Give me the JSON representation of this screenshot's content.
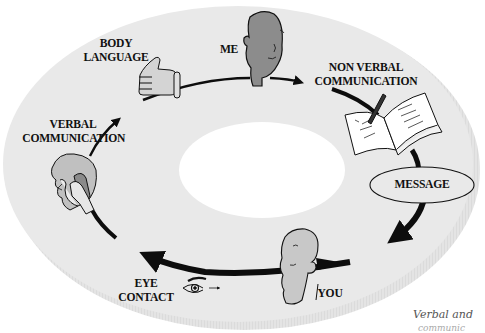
{
  "diagram": {
    "type": "communication-cycle",
    "nodes": [
      {
        "id": "me",
        "label": "ME",
        "icon": "head-icon"
      },
      {
        "id": "non_verbal",
        "label_line1": "NON VERBAL",
        "label_line2": "COMMUNICATION",
        "icon": "book-pen-icon"
      },
      {
        "id": "message",
        "label": "MESSAGE",
        "icon": "ellipse-badge"
      },
      {
        "id": "you",
        "label": "YOU",
        "icon": "head-icon"
      },
      {
        "id": "eye_contact",
        "label_line1": "EYE",
        "label_line2": "CONTACT",
        "icon": "eye-icon"
      },
      {
        "id": "verbal",
        "label_line1": "VERBAL",
        "label_line2": "COMMUNICATION",
        "icon": "person-phone-icon"
      },
      {
        "id": "body_language",
        "label_line1": "BODY",
        "label_line2": "LANGUAGE",
        "icon": "thumbs-up-icon"
      }
    ],
    "edges": [
      {
        "from": "body_language",
        "to": "me"
      },
      {
        "from": "me",
        "to": "non_verbal"
      },
      {
        "from": "non_verbal",
        "to": "message"
      },
      {
        "from": "message",
        "to": "you"
      },
      {
        "from": "you",
        "to": "eye_contact"
      },
      {
        "from": "eye_contact",
        "to": "verbal"
      },
      {
        "from": "verbal",
        "to": "body_language"
      }
    ],
    "caption": "Verbal and",
    "caption_line2": "communic"
  },
  "colors": {
    "disk": "#e9e9e9",
    "disk_edge": "#d8d8d8",
    "hole": "#ffffff",
    "arrow": "#0d0d0d",
    "head_me": "#8c8c8c",
    "head_you": "#c8c8c8",
    "ink": "#111111"
  }
}
